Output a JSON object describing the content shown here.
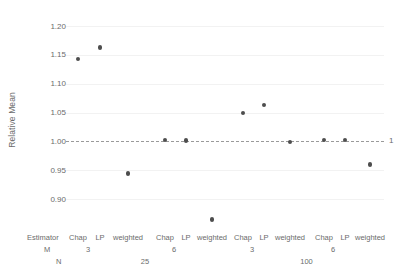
{
  "chart_data": {
    "type": "scatter",
    "title": "",
    "xlabel": "",
    "ylabel": "Relative Mean",
    "ylim": [
      0.88,
      1.21
    ],
    "yticks": [
      "0.90",
      "0.95",
      "1.00",
      "1.05",
      "1.10",
      "1.15",
      "1.20"
    ],
    "ytick_values": [
      0.9,
      0.95,
      1.0,
      1.05,
      1.1,
      1.15,
      1.2
    ],
    "grid": false,
    "legend": "none",
    "reference_line": {
      "value": 1.0,
      "label": "1",
      "style": "dashed"
    },
    "axis_row_headers": {
      "estimator": "Estimator",
      "m": "M",
      "n": "N"
    },
    "categories": [
      "Chap",
      "LP",
      "weighted",
      "Chap",
      "LP",
      "weighted",
      "Chap",
      "LP",
      "weighted",
      "Chap",
      "LP",
      "weighted"
    ],
    "values": [
      1.143,
      1.163,
      0.944,
      1.002,
      1.001,
      0.864,
      1.049,
      1.063,
      0.999,
      1.002,
      1.002,
      0.96
    ],
    "groups": [
      {
        "n": "25",
        "m_levels": [
          {
            "m": "3",
            "estimators": [
              "Chap",
              "LP",
              "weighted"
            ],
            "values": [
              1.143,
              1.163,
              0.944
            ]
          },
          {
            "m": "6",
            "estimators": [
              "Chap",
              "LP",
              "weighted"
            ],
            "values": [
              1.002,
              1.001,
              0.864
            ]
          }
        ]
      },
      {
        "n": "100",
        "m_levels": [
          {
            "m": "3",
            "estimators": [
              "Chap",
              "LP",
              "weighted"
            ],
            "values": [
              1.049,
              1.063,
              0.999
            ]
          },
          {
            "m": "6",
            "estimators": [
              "Chap",
              "LP",
              "weighted"
            ],
            "values": [
              1.002,
              1.002,
              0.96
            ]
          }
        ]
      }
    ],
    "points": [
      {
        "estimator": "Chap",
        "m": "3",
        "n": "25",
        "value": 1.143
      },
      {
        "estimator": "LP",
        "m": "3",
        "n": "25",
        "value": 1.163
      },
      {
        "estimator": "weighted",
        "m": "3",
        "n": "25",
        "value": 0.944
      },
      {
        "estimator": "Chap",
        "m": "6",
        "n": "25",
        "value": 1.002
      },
      {
        "estimator": "LP",
        "m": "6",
        "n": "25",
        "value": 1.001
      },
      {
        "estimator": "weighted",
        "m": "6",
        "n": "25",
        "value": 0.864
      },
      {
        "estimator": "Chap",
        "m": "3",
        "n": "100",
        "value": 1.049
      },
      {
        "estimator": "LP",
        "m": "3",
        "n": "100",
        "value": 1.063
      },
      {
        "estimator": "weighted",
        "m": "3",
        "n": "100",
        "value": 0.999
      },
      {
        "estimator": "Chap",
        "m": "6",
        "n": "100",
        "value": 1.002
      },
      {
        "estimator": "LP",
        "m": "6",
        "n": "100",
        "value": 1.002
      },
      {
        "estimator": "weighted",
        "m": "6",
        "n": "100",
        "value": 0.96
      }
    ],
    "colors": {
      "point": "#4d4d4d",
      "reference_line": "#9a9a9a",
      "text": "#6b6b6b"
    }
  }
}
